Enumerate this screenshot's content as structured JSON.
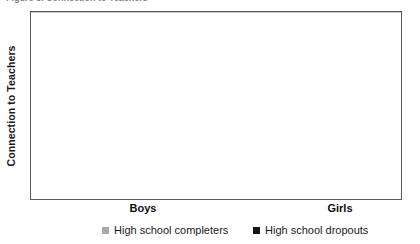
{
  "title_remnant": "Figure 3. Connection to Teachers",
  "axis": {
    "ylabel": "Connection to Teachers",
    "xlabel": ""
  },
  "legend": {
    "position": "bottom",
    "items": [
      {
        "label": "High school completers",
        "color": "#a8a8a8",
        "marker": "square-swatch"
      },
      {
        "label": "High school dropouts",
        "color": "#141414",
        "marker": "square-swatch"
      }
    ]
  },
  "colors": {
    "completers": "#a8a8a8",
    "dropouts": "#141414",
    "gridline": "#c8c8c8",
    "frame": "#5a5a5a",
    "text": "#1a1a1a",
    "background": "#ffffff"
  },
  "chart_data": {
    "type": "bar",
    "title": "",
    "xlabel": "",
    "ylabel": "Connection to Teachers",
    "categories": [
      "Boys",
      "Girls"
    ],
    "series": [
      {
        "name": "High school dropouts",
        "color": "#141414",
        "values": [
          0.54,
          0.51
        ]
      },
      {
        "name": "High school completers",
        "color": "#a8a8a8",
        "values": [
          0.6,
          0.89
        ]
      }
    ],
    "ylim": [
      0,
      1
    ],
    "yticks": [],
    "ytick_labels": [],
    "grid": true,
    "gridline_count": 9,
    "legend_position": "bottom",
    "bar_order_within_group": [
      "High school dropouts",
      "High school completers"
    ]
  },
  "layout": {
    "plot": {
      "left": 30,
      "top": 11,
      "width": 372,
      "height": 189
    },
    "bar_width_px": 48,
    "bars": [
      {
        "group": "Boys",
        "series": "High school dropouts",
        "x": 39,
        "height_frac": 0.54
      },
      {
        "group": "Boys",
        "series": "High school completers",
        "x": 98,
        "height_frac": 0.6
      },
      {
        "group": "Girls",
        "series": "High school dropouts",
        "x": 236,
        "height_frac": 0.51
      },
      {
        "group": "Girls",
        "series": "High school completers",
        "x": 295,
        "height_frac": 0.89
      }
    ],
    "category_label_centers": [
      113,
      310
    ],
    "legend_item_lefts": [
      72,
      223
    ]
  }
}
